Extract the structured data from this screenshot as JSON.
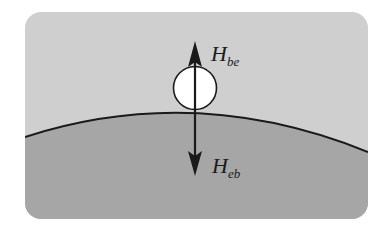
{
  "diagram": {
    "type": "physics-force-diagram",
    "colors": {
      "background": "#ffffff",
      "air_region": "#cfcfcf",
      "earth_region": "#a6a6a6",
      "curve": "#1a1a1a",
      "ball_fill": "#ffffff",
      "arrow": "#1a1a1a"
    },
    "labels": {
      "upper_force": {
        "main": "H",
        "sub": "be"
      },
      "lower_force": {
        "main": "H",
        "sub": "eb"
      }
    },
    "elements": [
      "rounded-rectangle frame",
      "light gray upper region",
      "darker gray earth region with curved boundary",
      "white ball resting on curve",
      "upward arrow from ball",
      "downward arrow into earth"
    ]
  }
}
